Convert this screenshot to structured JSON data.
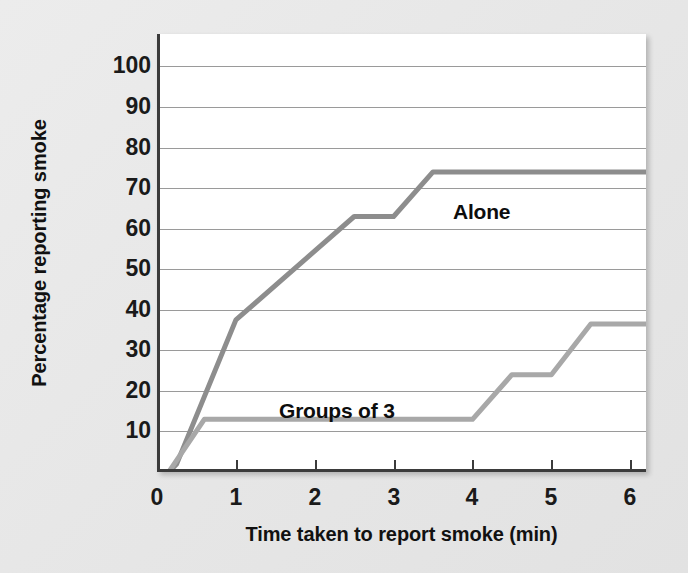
{
  "chart_data": {
    "type": "line",
    "title": "",
    "subtitle": "",
    "xlabel": "Time taken to report smoke (min)",
    "ylabel": "Percentage reporting smoke",
    "xlim": [
      0,
      6.2
    ],
    "ylim": [
      0,
      108
    ],
    "xticks": [
      0,
      1,
      2,
      3,
      4,
      5,
      6
    ],
    "xtick_labels": [
      "0",
      "1",
      "2",
      "3",
      "4",
      "5",
      "6"
    ],
    "yticks": [
      10,
      20,
      30,
      40,
      50,
      60,
      70,
      80,
      90,
      100
    ],
    "ytick_labels": [
      "10",
      "20",
      "30",
      "40",
      "50",
      "60",
      "70",
      "80",
      "90",
      "100"
    ],
    "grid": "horizontal",
    "legend_position": "inline-annotation",
    "series": [
      {
        "name": "Alone",
        "color": "#8d8d8d",
        "label_x": 3.75,
        "label_y": 67,
        "x": [
          0.15,
          0.25,
          1.0,
          2.5,
          3.0,
          3.5,
          6.2
        ],
        "y": [
          0,
          2,
          37.5,
          63,
          63,
          74,
          74
        ]
      },
      {
        "name": "Groups of 3",
        "color": "#a8a8a8",
        "label_x": 1.55,
        "label_y": 18,
        "x": [
          0.15,
          0.6,
          4.0,
          4.5,
          5.0,
          5.5,
          6.2
        ],
        "y": [
          0,
          13,
          13,
          24,
          24,
          36.5,
          36.5
        ]
      }
    ],
    "annotations": [
      {
        "text": "Alone",
        "x": 3.75,
        "y": 67
      },
      {
        "text": "Groups of 3",
        "x": 1.55,
        "y": 18
      }
    ]
  },
  "colors": {
    "page_background": "#e9e9e9",
    "plot_background": "#ffffff",
    "axis": "#3b3b3b",
    "gridline": "#9a9a9a",
    "series_alone": "#8d8d8d",
    "series_groups": "#a8a8a8",
    "text": "#111111"
  }
}
